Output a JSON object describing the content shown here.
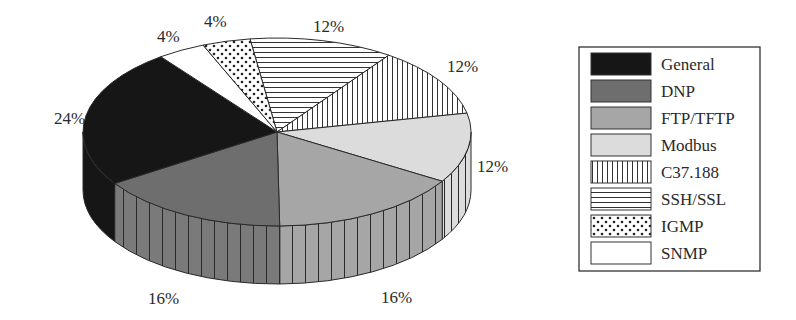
{
  "chart_data": {
    "type": "pie",
    "style": "3d-pie",
    "title": "",
    "categories": [
      "General",
      "DNP",
      "FTP/TFTP",
      "Modbus",
      "C37.188",
      "SSH/SSL",
      "IGMP",
      "SNMP"
    ],
    "values": [
      24,
      16,
      16,
      12,
      12,
      12,
      4,
      4
    ],
    "labels": [
      "24%",
      "16%",
      "16%",
      "12%",
      "12%",
      "12%",
      "4%",
      "4%"
    ],
    "legend": {
      "position": "right",
      "entries": [
        {
          "label": "General",
          "fill": "#161616",
          "pattern": "solid"
        },
        {
          "label": "DNP",
          "fill": "#6e6e6e",
          "pattern": "solid"
        },
        {
          "label": "FTP/TFTP",
          "fill": "#a6a6a6",
          "pattern": "solid"
        },
        {
          "label": "Modbus",
          "fill": "#dcdcdc",
          "pattern": "solid"
        },
        {
          "label": "C37.188",
          "fill": "#ffffff",
          "pattern": "vertical-lines"
        },
        {
          "label": "SSH/SSL",
          "fill": "#ffffff",
          "pattern": "horizontal-lines"
        },
        {
          "label": "IGMP",
          "fill": "#ffffff",
          "pattern": "dots"
        },
        {
          "label": "SNMP",
          "fill": "#ffffff",
          "pattern": "none"
        }
      ]
    }
  },
  "labels": {
    "general": "24%",
    "dnp": "16%",
    "ftp": "16%",
    "modbus": "12%",
    "c37": "12%",
    "ssh": "12%",
    "igmp": "4%",
    "snmp": "4%"
  },
  "legend": {
    "items": [
      "General",
      "DNP",
      "FTP/TFTP",
      "Modbus",
      "C37.188",
      "SSH/SSL",
      "IGMP",
      "SNMP"
    ]
  }
}
